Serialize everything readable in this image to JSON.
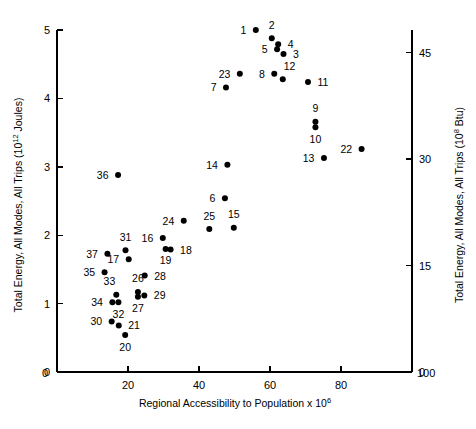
{
  "chart_data": {
    "type": "scatter",
    "title": "",
    "xlabel": "Regional Accessibility to Population x 10",
    "xlabel_exponent": "6",
    "ylabel": "Total Energy, All Modes, All Trips (10",
    "ylabel_exponent": "12",
    "ylabel_tail": " Joules)",
    "ylabel_right": "Total Energy, All Modes, All Trips (10",
    "ylabel_right_exponent": "8",
    "ylabel_right_tail": " Btu)",
    "xlim": [
      0,
      100
    ],
    "ylim": [
      0,
      5
    ],
    "ylim_right": [
      0,
      48.2
    ],
    "xticks": [
      0,
      20,
      40,
      60,
      80,
      100
    ],
    "xticklabels": [
      "0",
      "20",
      "40",
      "60",
      "80",
      "100"
    ],
    "yticks": [
      0,
      1,
      2,
      3,
      4,
      5
    ],
    "yticklabels": [
      "0",
      "1",
      "2",
      "3",
      "4",
      "5"
    ],
    "yticks_right": [
      0,
      15,
      30,
      45
    ],
    "yticklabels_right": [
      "0",
      "15",
      "30",
      "45"
    ],
    "grid": false,
    "legend": false,
    "points": [
      {
        "label": "1",
        "x": 56.0,
        "y": 5.0,
        "lp": "left"
      },
      {
        "label": "2",
        "x": 60.5,
        "y": 4.88,
        "lp": "above"
      },
      {
        "label": "4",
        "x": 62.3,
        "y": 4.79,
        "lp": "right"
      },
      {
        "label": "5",
        "x": 62.0,
        "y": 4.72,
        "lp": "left"
      },
      {
        "label": "3",
        "x": 63.8,
        "y": 4.65,
        "lp": "right"
      },
      {
        "label": "23",
        "x": 51.5,
        "y": 4.36,
        "lp": "left"
      },
      {
        "label": "8",
        "x": 61.2,
        "y": 4.36,
        "lp": "left"
      },
      {
        "label": "12",
        "x": 63.6,
        "y": 4.28,
        "lp": "above-right"
      },
      {
        "label": "11",
        "x": 70.7,
        "y": 4.24,
        "lp": "right"
      },
      {
        "label": "7",
        "x": 47.6,
        "y": 4.16,
        "lp": "left"
      },
      {
        "label": "9",
        "x": 72.8,
        "y": 3.66,
        "lp": "above"
      },
      {
        "label": "10",
        "x": 72.8,
        "y": 3.58,
        "lp": "below"
      },
      {
        "label": "22",
        "x": 85.8,
        "y": 3.26,
        "lp": "left"
      },
      {
        "label": "13",
        "x": 75.2,
        "y": 3.13,
        "lp": "left"
      },
      {
        "label": "14",
        "x": 48.0,
        "y": 3.03,
        "lp": "left"
      },
      {
        "label": "36",
        "x": 17.2,
        "y": 2.88,
        "lp": "left"
      },
      {
        "label": "6",
        "x": 47.3,
        "y": 2.54,
        "lp": "left"
      },
      {
        "label": "24",
        "x": 35.7,
        "y": 2.21,
        "lp": "left"
      },
      {
        "label": "25",
        "x": 42.9,
        "y": 2.09,
        "lp": "above"
      },
      {
        "label": "15",
        "x": 49.8,
        "y": 2.11,
        "lp": "above"
      },
      {
        "label": "16",
        "x": 29.8,
        "y": 1.96,
        "lp": "left"
      },
      {
        "label": "31",
        "x": 19.3,
        "y": 1.78,
        "lp": "above"
      },
      {
        "label": "19",
        "x": 30.6,
        "y": 1.8,
        "lp": "below"
      },
      {
        "label": "18",
        "x": 32.0,
        "y": 1.79,
        "lp": "right"
      },
      {
        "label": "37",
        "x": 14.2,
        "y": 1.73,
        "lp": "left"
      },
      {
        "label": "17",
        "x": 20.2,
        "y": 1.65,
        "lp": "left"
      },
      {
        "label": "35",
        "x": 13.4,
        "y": 1.46,
        "lp": "left"
      },
      {
        "label": "28",
        "x": 24.7,
        "y": 1.41,
        "lp": "right"
      },
      {
        "label": "26",
        "x": 22.8,
        "y": 1.17,
        "lp": "above"
      },
      {
        "label": "27",
        "x": 22.8,
        "y": 1.1,
        "lp": "below"
      },
      {
        "label": "29",
        "x": 24.6,
        "y": 1.12,
        "lp": "right"
      },
      {
        "label": "33",
        "x": 16.7,
        "y": 1.13,
        "lp": "above-left"
      },
      {
        "label": "34",
        "x": 15.6,
        "y": 1.02,
        "lp": "left"
      },
      {
        "label": "32",
        "x": 17.3,
        "y": 1.02,
        "lp": "below"
      },
      {
        "label": "30",
        "x": 15.4,
        "y": 0.74,
        "lp": "left"
      },
      {
        "label": "21",
        "x": 17.4,
        "y": 0.68,
        "lp": "right"
      },
      {
        "label": "20",
        "x": 19.2,
        "y": 0.54,
        "lp": "below"
      }
    ]
  }
}
